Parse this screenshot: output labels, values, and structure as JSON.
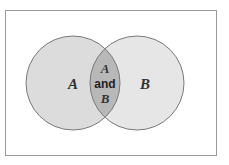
{
  "diagram": {
    "type": "venn",
    "sets": [
      {
        "label": "A"
      },
      {
        "label": "B"
      }
    ],
    "intersection": {
      "line1": "A",
      "line2": "and",
      "line3": "B"
    },
    "colors": {
      "background": "#ffffff",
      "border": "#9a9a9a",
      "circle_fill": "#dcdcdc",
      "intersection_fill": "#b8b8b8",
      "stroke": "#7a7a7a"
    }
  }
}
